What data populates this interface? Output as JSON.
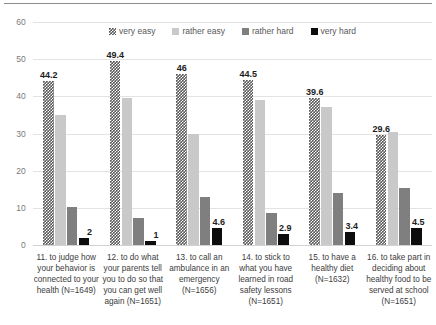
{
  "chart_data": {
    "type": "bar",
    "title": "",
    "subtitle": "",
    "xlabel": "",
    "ylabel": "",
    "ylim": [
      0,
      60
    ],
    "ytick_labels": [
      "60",
      "50",
      "40",
      "30",
      "20",
      "10",
      "0"
    ],
    "ytick_values": [
      60,
      50,
      40,
      30,
      20,
      10,
      0
    ],
    "grid": true,
    "legend_position": "top-center",
    "grouping": "grouped",
    "categories": [
      "11. to judge how your behavior is connected to your health (N=1649)",
      "12. to do what your parents tell you to do so that you can get well again (N=1651)",
      "13. to call an ambulance in an emergency (N=1656)",
      "14. to stick to what you have learned in road safety lessons (N=1651)",
      "15. to have a healthy diet (N=1632)",
      "16. to take part in deciding about healthy food to be served at school (N=1651)"
    ],
    "category_lines": [
      [
        "11. to judge how",
        "your behavior is",
        "connected to your",
        "health (N=1649)"
      ],
      [
        "12. to do what",
        "your parents tell",
        "you to do so that",
        "you can get well",
        "again (N=1651)"
      ],
      [
        "13. to call an",
        "ambulance in an",
        "emergency",
        "(N=1656)"
      ],
      [
        "14. to stick to",
        "what you have",
        "learned in road",
        "safety lessons",
        "(N=1651)"
      ],
      [
        "15. to have a",
        "healthy diet",
        "(N=1632)"
      ],
      [
        "16. to take part in",
        "deciding about",
        "healthy food to be",
        "served at school",
        "(N=1651)"
      ]
    ],
    "series": [
      {
        "name": "very easy",
        "color": "#585858",
        "pattern": "checkered",
        "values": [
          44.2,
          49.4,
          46,
          44.5,
          39.6,
          29.6
        ],
        "labels": [
          "44.2",
          "49.4",
          "46",
          "44.5",
          "39.6",
          "29.6"
        ]
      },
      {
        "name": "rather easy",
        "color": "#c9c9c9",
        "pattern": "solid",
        "values": [
          35.0,
          39.5,
          30.0,
          38.9,
          37.0,
          30.5
        ],
        "labels": [
          "",
          "",
          "",
          "",
          "",
          ""
        ]
      },
      {
        "name": "rather hard",
        "color": "#7f7f7f",
        "pattern": "solid",
        "values": [
          10.3,
          7.2,
          13.0,
          8.5,
          14.0,
          15.3
        ],
        "labels": [
          "",
          "",
          "",
          "",
          "",
          ""
        ]
      },
      {
        "name": "very hard",
        "color": "#0d0d0d",
        "pattern": "solid",
        "values": [
          2,
          1,
          4.6,
          2.9,
          3.4,
          4.5
        ],
        "labels": [
          "2",
          "1",
          "4.6",
          "2.9",
          "3.4",
          "4.5"
        ]
      }
    ]
  }
}
